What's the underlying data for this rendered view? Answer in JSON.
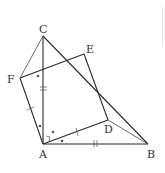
{
  "diagram": {
    "type": "geometry-figure",
    "points": {
      "C": {
        "label": "C",
        "x": 43,
        "y": 36
      },
      "E": {
        "label": "E",
        "x": 84,
        "y": 54
      },
      "F": {
        "label": "F",
        "x": 20,
        "y": 78
      },
      "A": {
        "label": "A",
        "x": 43,
        "y": 144
      },
      "D": {
        "label": "D",
        "x": 108,
        "y": 120
      },
      "B": {
        "label": "B",
        "x": 148,
        "y": 144
      }
    },
    "labels": {
      "C": "C",
      "E": "E",
      "F": "F",
      "A": "A",
      "D": "D",
      "B": "B"
    },
    "segments": [
      "AC",
      "CB",
      "AB",
      "CF",
      "FA",
      "FE",
      "ED",
      "AD",
      "DB"
    ],
    "markings": {
      "AC_AB": "double tick (equal)",
      "AF_AD": "single tick (equal)",
      "angles_marked_dot": [
        "CFE region near F",
        "FAC",
        "CAD",
        "DAB"
      ],
      "right_angle_at_A": "small square between AC and AD region"
    },
    "colors": {
      "line": "#2a2a2a",
      "text": "#333333",
      "background": "#ffffff"
    }
  }
}
